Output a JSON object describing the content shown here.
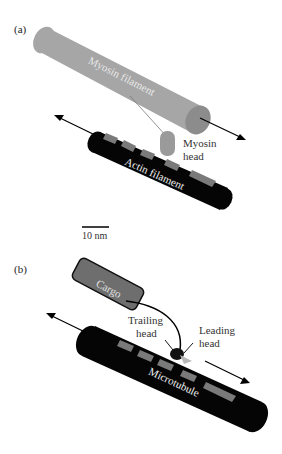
{
  "figure": {
    "panel_a": {
      "label": "(a)",
      "myosin_filament": "Myosin filament",
      "myosin_head": [
        "Myosin",
        "head"
      ],
      "actin_filament": "Actin filament"
    },
    "scale_bar": {
      "label": "10 nm"
    },
    "panel_b": {
      "label": "(b)",
      "cargo": "Cargo",
      "trailing_head": [
        "Trailing",
        "head"
      ],
      "leading_head": [
        "Leading",
        "head"
      ],
      "microtubule": "Microtubule"
    },
    "colors": {
      "myosin": "#a6a6a6",
      "myosin_end": "#8c8c8c",
      "track": "#050505",
      "subunit": "#7a7a7a",
      "cargo": "#6e6e6e",
      "leading_head": "#b8b8b8"
    }
  }
}
